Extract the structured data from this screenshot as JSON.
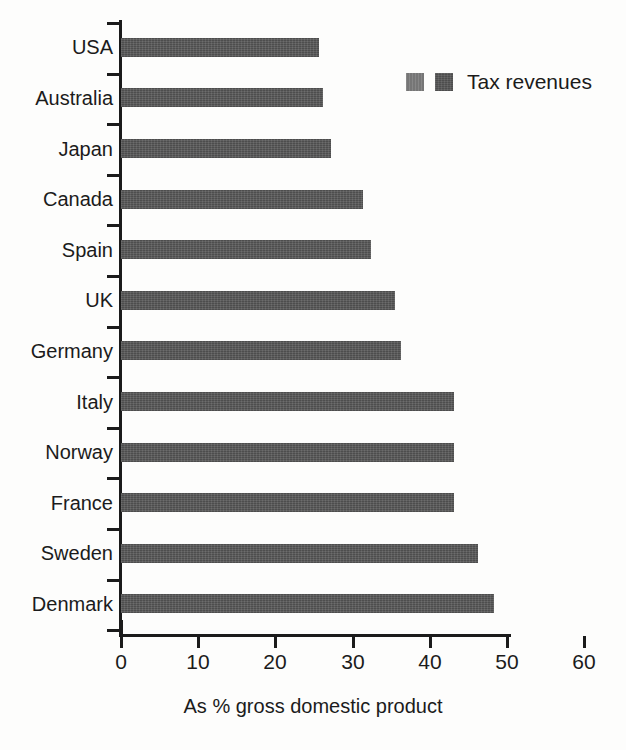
{
  "chart_data": {
    "type": "bar",
    "orientation": "horizontal",
    "title": "",
    "xlabel": "As % gross domestic product",
    "ylabel": "",
    "xlim": [
      0,
      60
    ],
    "xticks": [
      0,
      10,
      20,
      30,
      40,
      50,
      60
    ],
    "xtick_labels": [
      "0",
      "10",
      "20",
      "30",
      "40",
      "50",
      "60"
    ],
    "grid": false,
    "legend": {
      "position": "top-right",
      "entries": [
        {
          "label": "Tax revenues",
          "swatches": [
            "#767676",
            "#565656"
          ]
        }
      ]
    },
    "categories": [
      "USA",
      "Australia",
      "Japan",
      "Canada",
      "Spain",
      "UK",
      "Germany",
      "Italy",
      "Norway",
      "France",
      "Sweden",
      "Denmark"
    ],
    "series": [
      {
        "name": "Tax revenues",
        "color": "#565656",
        "values": [
          25.6,
          26.2,
          27.2,
          31.3,
          32.4,
          35.5,
          36.3,
          43.1,
          43.1,
          43.1,
          46.3,
          48.3
        ]
      }
    ]
  },
  "colors": {
    "bar": "#565656",
    "legend_light": "#767676",
    "axis": "#1b1b1b",
    "background": "#fdfdfc"
  }
}
